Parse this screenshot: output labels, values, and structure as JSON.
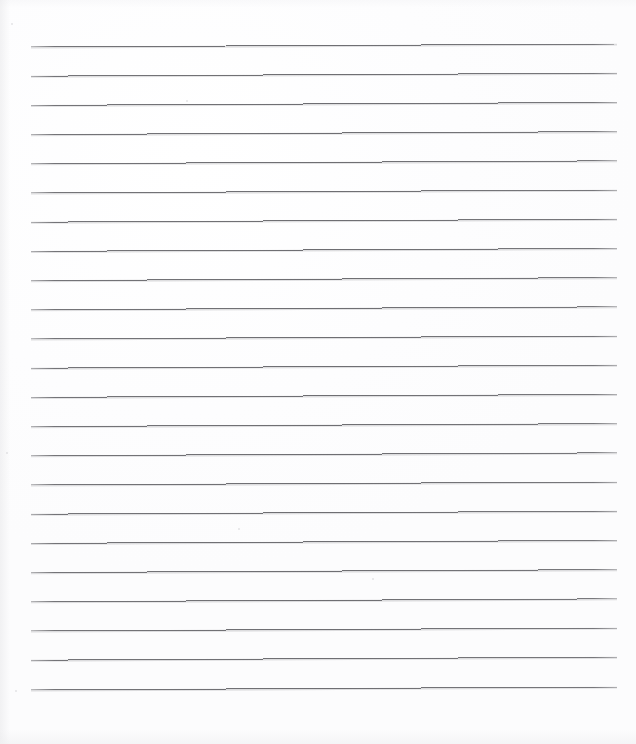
{
  "document": {
    "kind": "lined-paper-scan",
    "title": "Blank Ruled Notebook Page",
    "description": "Scanned blank sheet of wide-ruled writing paper with no handwriting or printed text.",
    "page_width": 636,
    "page_height": 744,
    "background_color": "#fdfdfd",
    "has_text_content": false,
    "handwriting_present": false,
    "margin_rule_present": false,
    "holes_punched": false
  },
  "ruling": {
    "line_count": 23,
    "line_color": "#6e6e72",
    "line_thickness_px": 1,
    "line_spacing_px": 29.2,
    "first_line_y": 47,
    "last_line_y": 690,
    "line_start_x": 31,
    "line_end_x": 617,
    "line_length_px": 586,
    "tilt_description": "very slight upward slope toward the right edge",
    "tilt_rise_px": 3,
    "top_margin_px": 47,
    "bottom_margin_px": 54,
    "left_margin_px": 31,
    "right_margin_px": 19,
    "lines": [
      {
        "index": 1,
        "y_left": 47.0,
        "y_right": 44.0
      },
      {
        "index": 2,
        "y_left": 76.2,
        "y_right": 73.2
      },
      {
        "index": 3,
        "y_left": 105.4,
        "y_right": 102.4
      },
      {
        "index": 4,
        "y_left": 134.6,
        "y_right": 131.6
      },
      {
        "index": 5,
        "y_left": 163.8,
        "y_right": 160.8
      },
      {
        "index": 6,
        "y_left": 193.0,
        "y_right": 190.0
      },
      {
        "index": 7,
        "y_left": 222.2,
        "y_right": 219.2
      },
      {
        "index": 8,
        "y_left": 251.4,
        "y_right": 248.4
      },
      {
        "index": 9,
        "y_left": 280.6,
        "y_right": 277.6
      },
      {
        "index": 10,
        "y_left": 309.8,
        "y_right": 306.8
      },
      {
        "index": 11,
        "y_left": 339.0,
        "y_right": 336.0
      },
      {
        "index": 12,
        "y_left": 368.2,
        "y_right": 365.2
      },
      {
        "index": 13,
        "y_left": 397.4,
        "y_right": 394.4
      },
      {
        "index": 14,
        "y_left": 426.6,
        "y_right": 423.6
      },
      {
        "index": 15,
        "y_left": 455.8,
        "y_right": 452.8
      },
      {
        "index": 16,
        "y_left": 485.0,
        "y_right": 482.0
      },
      {
        "index": 17,
        "y_left": 514.2,
        "y_right": 511.2
      },
      {
        "index": 18,
        "y_left": 543.4,
        "y_right": 540.4
      },
      {
        "index": 19,
        "y_left": 572.6,
        "y_right": 569.6
      },
      {
        "index": 20,
        "y_left": 601.8,
        "y_right": 598.8
      },
      {
        "index": 21,
        "y_left": 631.0,
        "y_right": 628.0
      },
      {
        "index": 22,
        "y_left": 660.2,
        "y_right": 657.2
      },
      {
        "index": 23,
        "y_left": 690.0,
        "y_right": 687.0
      }
    ]
  },
  "artifacts": {
    "specks": [
      {
        "x": 11,
        "y": 23,
        "size": 2
      },
      {
        "x": 186,
        "y": 100,
        "size": 2
      },
      {
        "x": 238,
        "y": 528,
        "size": 2
      },
      {
        "x": 372,
        "y": 578,
        "size": 2
      },
      {
        "x": 6,
        "y": 452,
        "size": 2
      },
      {
        "x": 15,
        "y": 690,
        "size": 2
      }
    ]
  }
}
